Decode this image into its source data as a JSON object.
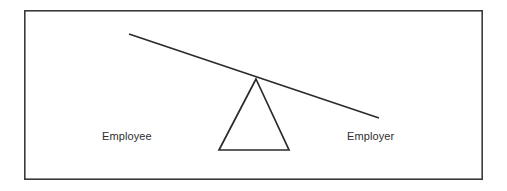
{
  "diagram": {
    "type": "seesaw-balance-diagram",
    "title_visible": false,
    "background_color": "#ffffff",
    "border": {
      "color": "#3a3a3a",
      "width_px": 1.6,
      "x": 24,
      "y": 10,
      "width": 459,
      "height": 170
    },
    "labels": {
      "left": "Employee",
      "right": "Employer"
    },
    "label_style": {
      "color": "#2e2e2e",
      "font_size_px": 11
    },
    "beam": {
      "name": "balance-beam",
      "color": "#2b2b2b",
      "stroke_width_px": 1.7,
      "x1": 129,
      "y1": 34,
      "x2": 379,
      "y2": 118,
      "tilt": "down-to-the-right"
    },
    "fulcrum": {
      "name": "fulcrum-triangle",
      "color": "#2b2b2b",
      "stroke_width_px": 1.7,
      "apex_x": 256,
      "apex_y": 79,
      "base_left_x": 219,
      "base_right_x": 289,
      "base_y": 150
    },
    "meaning": "An unbalanced seesaw: the Employee side is raised and the Employer side is lowered, indicating power imbalance favoring the Employer."
  }
}
